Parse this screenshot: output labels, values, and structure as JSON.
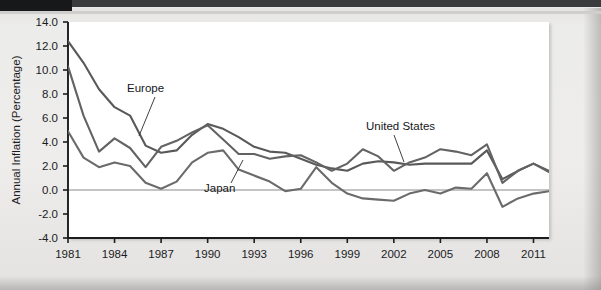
{
  "chart_data": {
    "type": "line",
    "title": "",
    "xlabel": "",
    "ylabel": "Annual Inflation (Percentage)",
    "xlim": [
      1981,
      2012
    ],
    "ylim": [
      -4.0,
      14.0
    ],
    "grid": false,
    "legend_position": "inline-annotations",
    "y_ticks": [
      "14.0",
      "12.0",
      "10.0",
      "8.0",
      "6.0",
      "4.0",
      "2.0",
      "0.0",
      "-2.0",
      "-4.0"
    ],
    "y_tick_values": [
      14.0,
      12.0,
      10.0,
      8.0,
      6.0,
      4.0,
      2.0,
      0.0,
      -2.0,
      -4.0
    ],
    "x_ticks": [
      "1981",
      "1984",
      "1987",
      "1990",
      "1993",
      "1996",
      "1999",
      "2002",
      "2005",
      "2008",
      "2011"
    ],
    "x_tick_values": [
      1981,
      1984,
      1987,
      1990,
      1993,
      1996,
      1999,
      2002,
      2005,
      2008,
      2011
    ],
    "x": [
      1981,
      1982,
      1983,
      1984,
      1985,
      1986,
      1987,
      1988,
      1989,
      1990,
      1991,
      1992,
      1993,
      1994,
      1995,
      1996,
      1997,
      1998,
      1999,
      2000,
      2001,
      2002,
      2003,
      2004,
      2005,
      2006,
      2007,
      2008,
      2009,
      2010,
      2011,
      2012
    ],
    "series": [
      {
        "name": "Europe",
        "color": "#595959",
        "values": [
          12.4,
          10.6,
          8.4,
          6.9,
          6.2,
          3.7,
          3.1,
          3.3,
          4.6,
          5.5,
          5.1,
          4.4,
          3.6,
          3.2,
          3.1,
          2.6,
          2.1,
          1.8,
          1.6,
          2.2,
          2.4,
          2.3,
          2.1,
          2.2,
          2.2,
          2.2,
          2.2,
          3.3,
          0.9,
          1.6,
          2.2,
          1.6
        ]
      },
      {
        "name": "United States",
        "color": "#636363",
        "values": [
          10.3,
          6.2,
          3.2,
          4.3,
          3.5,
          1.9,
          3.6,
          4.1,
          4.8,
          5.4,
          4.2,
          3.0,
          3.0,
          2.6,
          2.8,
          2.9,
          2.3,
          1.6,
          2.2,
          3.4,
          2.8,
          1.6,
          2.3,
          2.7,
          3.4,
          3.2,
          2.9,
          3.8,
          0.6,
          1.6,
          2.2,
          1.5
        ]
      },
      {
        "name": "Japan",
        "color": "#6b6b6b",
        "values": [
          4.9,
          2.7,
          1.9,
          2.3,
          2.0,
          0.6,
          0.1,
          0.7,
          2.3,
          3.1,
          3.3,
          1.7,
          1.2,
          0.7,
          -0.1,
          0.1,
          1.9,
          0.6,
          -0.3,
          -0.7,
          -0.8,
          -0.9,
          -0.3,
          0.0,
          -0.3,
          0.2,
          0.1,
          1.4,
          -1.4,
          -0.7,
          -0.3,
          -0.1
        ]
      }
    ],
    "annotations": [
      {
        "text": "Europe",
        "label_x": 127,
        "label_y": 92,
        "leader_x1": 155,
        "leader_y1": 97,
        "leader_x2": 139,
        "leader_y2": 136
      },
      {
        "text": "Japan",
        "label_x": 204,
        "label_y": 192,
        "leader_x1": 231,
        "leader_y1": 183,
        "leader_x2": 243,
        "leader_y2": 160
      },
      {
        "text": "United States",
        "label_x": 366,
        "label_y": 130,
        "leader_x1": 394,
        "leader_y1": 135,
        "leader_x2": 404,
        "leader_y2": 162
      }
    ]
  },
  "colors": {
    "line": "#5e5e5e",
    "axis": "#1b1c1e",
    "zero_line": "#8a8a8a",
    "plot_background": "#ffffff",
    "page_background": "#ecebea"
  }
}
